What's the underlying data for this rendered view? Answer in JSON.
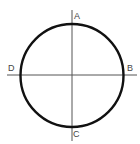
{
  "diagram": {
    "type": "circle-with-axes",
    "circle": {
      "cx": 72,
      "cy": 75.5,
      "r": 51.5,
      "stroke": "#111111",
      "stroke_width": 2.4
    },
    "axes": {
      "vertical": {
        "x": 72,
        "y1": 10,
        "y2": 141,
        "stroke": "#555555"
      },
      "horizontal": {
        "y": 75,
        "x1": 7,
        "x2": 137,
        "stroke": "#555555"
      }
    },
    "labels": {
      "top": "A",
      "right": "B",
      "bottom": "C",
      "left": "D"
    }
  }
}
